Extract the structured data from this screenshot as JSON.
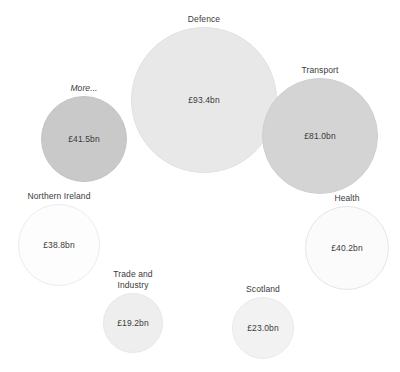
{
  "chart_data": {
    "type": "bubble",
    "title": "",
    "subtitle": "",
    "xlabel": "",
    "ylabel": "",
    "grid": false,
    "legend": "none",
    "value_prefix": "£",
    "value_suffix": "bn",
    "size_encoding": "area-proportional-to-value",
    "categories": [
      "Defence",
      "Transport",
      "More...",
      "Health",
      "Northern Ireland",
      "Scotland",
      "Trade and Industry"
    ],
    "values": [
      93.4,
      81.0,
      41.5,
      40.2,
      38.8,
      23.0,
      19.2
    ],
    "points": [
      {
        "label": "Defence",
        "value": 93.4,
        "value_text": "£93.4bn",
        "fill": "#e8e8e8",
        "stroke": "#e2e2e2",
        "cx": 204,
        "cy": 100,
        "r": 73,
        "label_italic": false,
        "label_lines": [
          "Defence"
        ]
      },
      {
        "label": "Transport",
        "value": 81.0,
        "value_text": "£81.0bn",
        "fill": "#d4d4d4",
        "stroke": "#cfcfcf",
        "cx": 320,
        "cy": 136,
        "r": 58,
        "label_italic": false,
        "label_lines": [
          "Transport"
        ]
      },
      {
        "label": "More...",
        "value": 41.5,
        "value_text": "£41.5bn",
        "fill": "#c9c9c9",
        "stroke": "#c4c4c4",
        "cx": 84,
        "cy": 139,
        "r": 43,
        "label_italic": true,
        "label_lines": [
          "More..."
        ]
      },
      {
        "label": "Health",
        "value": 40.2,
        "value_text": "£40.2bn",
        "fill": "#fbfbfb",
        "stroke": "#e6e6e6",
        "cx": 347,
        "cy": 248,
        "r": 42,
        "label_italic": false,
        "label_lines": [
          "Health"
        ]
      },
      {
        "label": "Northern Ireland",
        "value": 38.8,
        "value_text": "£38.8bn",
        "fill": "#fdfdfd",
        "stroke": "#ececec",
        "cx": 59,
        "cy": 245,
        "r": 41,
        "label_italic": false,
        "label_lines": [
          "Northern Ireland"
        ]
      },
      {
        "label": "Scotland",
        "value": 23.0,
        "value_text": "£23.0bn",
        "fill": "#f2f2f2",
        "stroke": "#ebebeb",
        "cx": 263,
        "cy": 328,
        "r": 31,
        "label_italic": false,
        "label_lines": [
          "Scotland"
        ]
      },
      {
        "label": "Trade and Industry",
        "value": 19.2,
        "value_text": "£19.2bn",
        "fill": "#eeeeee",
        "stroke": "#e7e7e7",
        "cx": 133,
        "cy": 323,
        "r": 30,
        "label_italic": false,
        "label_lines": [
          "Trade and",
          "Industry"
        ]
      }
    ]
  }
}
